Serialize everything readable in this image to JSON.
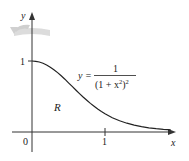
{
  "figure": {
    "type": "region-under-curve-rotated-about-y-axis",
    "axes": {
      "x_label": "x",
      "y_label": "y",
      "origin_label": "0",
      "x_tick_labels": [
        "1"
      ],
      "y_tick_labels": [
        "1"
      ]
    },
    "curve": {
      "equation_lhs": "y =",
      "numerator": "1",
      "denominator_base": "(1 + x",
      "denominator_inner_exp": "2",
      "denominator_close": ")",
      "denominator_outer_exp": "2",
      "x_range": [
        0,
        1.9
      ]
    },
    "region_label": "R",
    "rotation_icon": "rotation-arrow-icon",
    "colors": {
      "axes": "#333333",
      "curve": "#222222",
      "rotation_arrow": "#d8d8d8"
    }
  }
}
